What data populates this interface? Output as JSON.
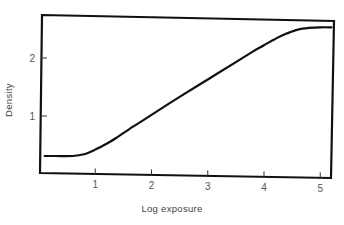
{
  "chart_data": {
    "type": "line",
    "title": "",
    "xlabel": "Log exposure",
    "ylabel": "Density",
    "xlim": [
      0,
      5.2
    ],
    "ylim": [
      0,
      2.8
    ],
    "x_ticks": [
      1,
      2,
      3,
      4,
      5
    ],
    "x_tick_labels": [
      "1",
      "2",
      "3",
      "4",
      "5"
    ],
    "y_ticks": [
      1,
      2
    ],
    "y_tick_labels": [
      "1",
      "2"
    ],
    "grid": false,
    "legend": null,
    "series": [
      {
        "name": "Characteristic curve",
        "x": [
          0.1,
          0.3,
          0.6,
          0.8,
          1.0,
          1.2,
          1.4,
          1.6,
          2.0,
          2.5,
          3.0,
          3.5,
          3.8,
          4.0,
          4.2,
          4.4,
          4.6,
          4.8,
          5.0,
          5.2
        ],
        "y": [
          0.31,
          0.31,
          0.31,
          0.34,
          0.42,
          0.52,
          0.64,
          0.77,
          1.02,
          1.33,
          1.63,
          1.93,
          2.11,
          2.22,
          2.33,
          2.42,
          2.49,
          2.52,
          2.53,
          2.53
        ]
      }
    ]
  },
  "axes": {
    "xlabel": "Log exposure",
    "ylabel": "Density"
  }
}
